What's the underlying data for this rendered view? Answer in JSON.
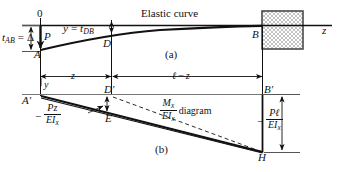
{
  "figure": {
    "title_a": "(a)",
    "title_b": "(b)",
    "elastic_curve_label": "Elastic curve",
    "axis_label_z": "z",
    "origin_label": "0"
  },
  "upper": {
    "points": {
      "A": "A",
      "B": "B",
      "D": "D",
      "P": "P"
    },
    "deflection_label": {
      "base": "t",
      "sub": "AB",
      "equals": "=",
      "delta": "Δ"
    },
    "y_equation": {
      "lhs": "y",
      "equals": "=",
      "rhs_base": "t",
      "rhs_sub": "DB"
    },
    "dimensions": {
      "short": "y",
      "z": "z",
      "remainder_l": "ℓ",
      "remainder_minus": "−",
      "remainder_z": "z"
    }
  },
  "lower": {
    "points": {
      "A_prime": "A'",
      "B_prime": "B'",
      "D_prime": "D'",
      "E": "E",
      "H": "H"
    },
    "moment_diagram": {
      "minus": "−",
      "numerator": "M",
      "numerator_sub": "x",
      "denominator": "EI",
      "denominator_sub": "x",
      "word": "diagram"
    },
    "pz_label": {
      "minus": "−",
      "numerator": "Pz",
      "denominator": "EI",
      "denominator_sub": "x"
    },
    "pl_label": {
      "minus": "−",
      "numerator": "Pℓ",
      "denominator": "EI",
      "denominator_sub": "x"
    }
  },
  "colors": {
    "ink": "#111111",
    "light_rule": "#888888",
    "hatch": "#9a9a9a",
    "paper": "#ffffff"
  }
}
